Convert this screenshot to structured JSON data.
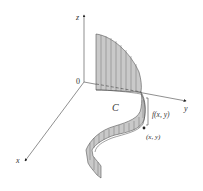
{
  "figure": {
    "axes": {
      "z_label": "z",
      "y_label": "y",
      "x_label": "x",
      "origin_label": "0"
    },
    "curve_label": "C",
    "height_label": "f(x, y)",
    "point_label": "(x, y)",
    "colors": {
      "surface_fill": "#c9c9c9",
      "surface_stroke": "#555555",
      "axis": "#444444",
      "text": "#333333"
    }
  }
}
